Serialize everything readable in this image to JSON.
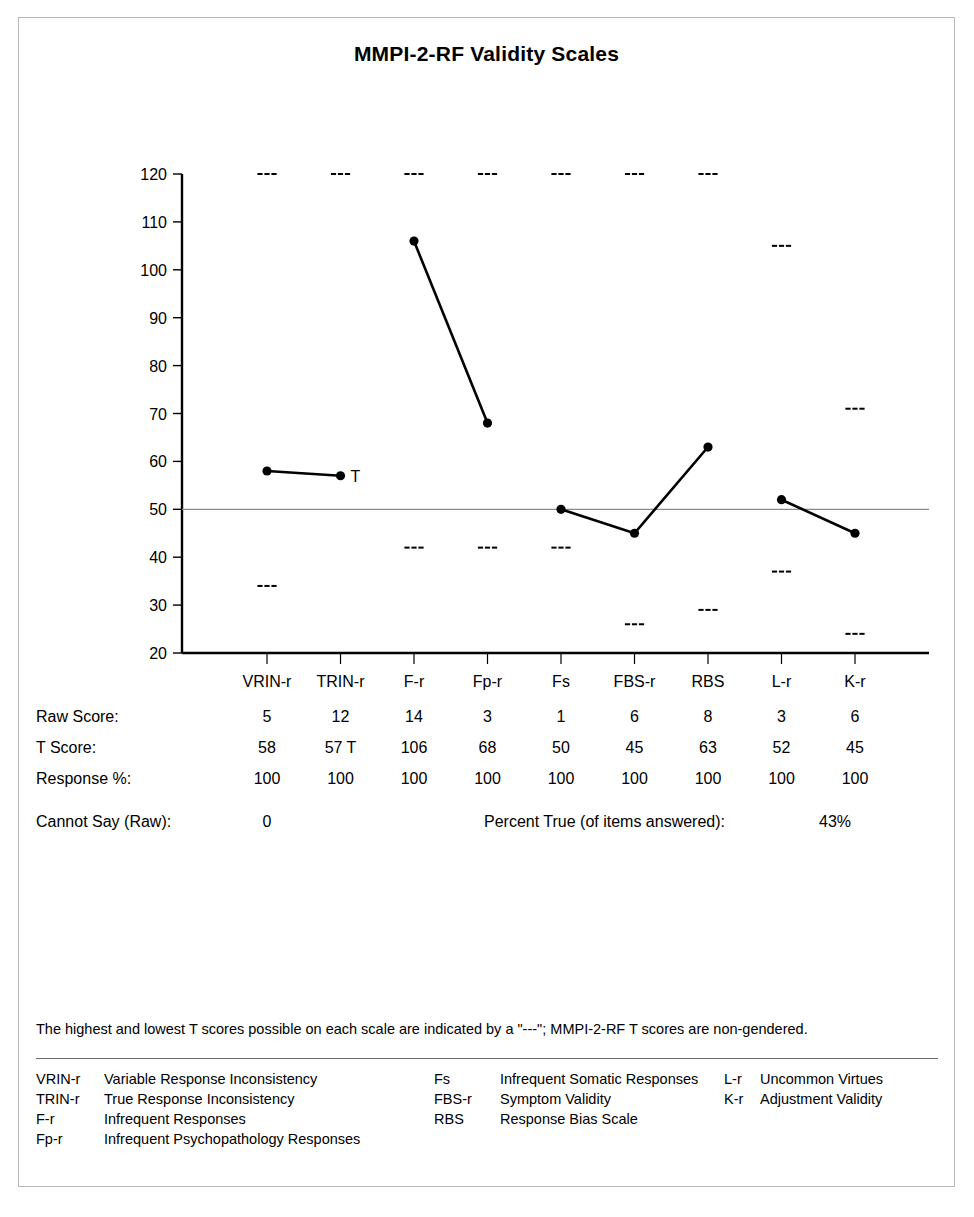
{
  "title": "MMPI-2-RF Validity Scales",
  "chart_data": {
    "type": "line",
    "title": "MMPI-2-RF Validity Scales",
    "xlabel": "",
    "ylabel": "",
    "ylim": [
      20,
      120
    ],
    "yticks": [
      20,
      30,
      40,
      50,
      60,
      70,
      80,
      90,
      100,
      110,
      120
    ],
    "grid": false,
    "reference_line": 50,
    "categories": [
      "VRIN-r",
      "TRIN-r",
      "F-r",
      "Fp-r",
      "Fs",
      "FBS-r",
      "RBS",
      "L-r",
      "K-r"
    ],
    "series": [
      {
        "name": "T Score",
        "values": [
          58,
          57,
          106,
          68,
          50,
          45,
          63,
          52,
          45
        ],
        "segments": [
          [
            0,
            1
          ],
          [
            2,
            3
          ],
          [
            4,
            5,
            6
          ],
          [
            7,
            8
          ]
        ]
      }
    ],
    "annotations": [
      {
        "scale": "TRIN-r",
        "text": "T",
        "value": 57
      }
    ],
    "max_possible_t": [
      120,
      120,
      120,
      120,
      120,
      120,
      120,
      105,
      71
    ],
    "min_possible_t": [
      34,
      20,
      42,
      42,
      42,
      26,
      29,
      37,
      24
    ],
    "min_possible_t_note": "TRIN-r lowest marker is at the axis floor (20)",
    "marker_symbol": "---"
  },
  "table": {
    "rows": [
      {
        "label": "Raw Score:",
        "values": [
          "5",
          "12",
          "14",
          "3",
          "1",
          "6",
          "8",
          "3",
          "6"
        ]
      },
      {
        "label": "T Score:",
        "values": [
          "58",
          "57 T",
          "106",
          "68",
          "50",
          "45",
          "63",
          "52",
          "45"
        ]
      },
      {
        "label": "Response %:",
        "values": [
          "100",
          "100",
          "100",
          "100",
          "100",
          "100",
          "100",
          "100",
          "100"
        ]
      }
    ],
    "cannot_say_label": "Cannot Say (Raw):",
    "cannot_say_value": "0",
    "percent_true_label": "Percent True (of items answered):",
    "percent_true_value": "43%"
  },
  "footnote": "The highest and lowest T scores possible on each scale are indicated by a \"---\"; MMPI-2-RF T scores are non-gendered.",
  "legend": {
    "column1": [
      {
        "abbr": "VRIN-r",
        "name": "Variable Response Inconsistency"
      },
      {
        "abbr": "TRIN-r",
        "name": "True Response Inconsistency"
      },
      {
        "abbr": "F-r",
        "name": "Infrequent Responses"
      },
      {
        "abbr": "Fp-r",
        "name": "Infrequent Psychopathology Responses"
      }
    ],
    "column2": [
      {
        "abbr": "Fs",
        "name": "Infrequent Somatic Responses"
      },
      {
        "abbr": "FBS-r",
        "name": "Symptom Validity"
      },
      {
        "abbr": "RBS",
        "name": "Response Bias Scale"
      }
    ],
    "column3": [
      {
        "abbr": "L-r",
        "name": "Uncommon Virtues"
      },
      {
        "abbr": "K-r",
        "name": "Adjustment Validity"
      }
    ]
  },
  "colors": {
    "ink": "#000000",
    "frame": "#b9b9b9",
    "reference_line": "#8a8a8a"
  }
}
